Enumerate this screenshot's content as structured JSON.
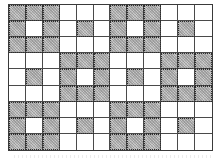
{
  "diagram": {
    "type": "shaded-grid-pattern",
    "columns": 12,
    "rows": 9,
    "colors": {
      "shaded": "#c9c9c9",
      "unshaded": "#ffffff",
      "grid_line": "#4a4a4a"
    },
    "legend": {
      "S": "shaded",
      "W": "white"
    },
    "cells": [
      [
        "S",
        "S",
        "S",
        "W",
        "W",
        "W",
        "S",
        "S",
        "S",
        "W",
        "W",
        "W"
      ],
      [
        "S",
        "W",
        "S",
        "W",
        "S",
        "W",
        "S",
        "W",
        "S",
        "W",
        "S",
        "W"
      ],
      [
        "S",
        "S",
        "S",
        "W",
        "W",
        "W",
        "S",
        "S",
        "S",
        "W",
        "W",
        "W"
      ],
      [
        "W",
        "W",
        "W",
        "S",
        "S",
        "S",
        "W",
        "W",
        "W",
        "S",
        "S",
        "S"
      ],
      [
        "W",
        "S",
        "W",
        "S",
        "W",
        "S",
        "W",
        "S",
        "W",
        "S",
        "W",
        "S"
      ],
      [
        "W",
        "W",
        "W",
        "S",
        "S",
        "S",
        "W",
        "W",
        "W",
        "S",
        "S",
        "S"
      ],
      [
        "S",
        "S",
        "S",
        "W",
        "W",
        "W",
        "S",
        "S",
        "S",
        "W",
        "W",
        "W"
      ],
      [
        "S",
        "W",
        "S",
        "W",
        "S",
        "W",
        "S",
        "W",
        "S",
        "W",
        "S",
        "W"
      ],
      [
        "S",
        "S",
        "S",
        "W",
        "W",
        "W",
        "S",
        "S",
        "S",
        "W",
        "W",
        "W"
      ]
    ]
  }
}
